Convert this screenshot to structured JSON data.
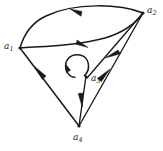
{
  "figure": {
    "kind": "directed-graph",
    "background_color": "#ffffff",
    "ink_color": "#1a1a1a",
    "width": 163,
    "height": 151
  },
  "nodes": [
    {
      "id": "a1",
      "label_base": "a",
      "label_sub": "1",
      "x": 20,
      "y": 48,
      "label_x": 4,
      "label_y": 42,
      "label_align": "right"
    },
    {
      "id": "a2",
      "label_base": "a",
      "label_sub": "2",
      "x": 143,
      "y": 13,
      "label_x": 147,
      "label_y": 6,
      "label_align": "left"
    },
    {
      "id": "a3",
      "label_base": "a",
      "label_sub": "3",
      "x": 87,
      "y": 78,
      "label_x": 91,
      "label_y": 74,
      "label_align": "left"
    },
    {
      "id": "a4",
      "label_base": "a",
      "label_sub": "4",
      "x": 79,
      "y": 126,
      "label_x": 73,
      "label_y": 133,
      "label_align": "left"
    }
  ],
  "edges": [
    {
      "id": "e-a2-a1-top",
      "from": "a2",
      "to": "a1",
      "style": "curved-arc-upper",
      "arrow_at": "mid",
      "arrow_direction": "left"
    },
    {
      "id": "e-a1-a2-bottom",
      "from": "a1",
      "to": "a2",
      "style": "curved-arc-lower",
      "arrow_at": "mid",
      "arrow_direction": "right"
    },
    {
      "id": "e-a2-a3",
      "from": "a2",
      "to": "a3",
      "style": "straight",
      "arrow_at": "mid",
      "arrow_direction": "down-left"
    },
    {
      "id": "e-a3-a4",
      "from": "a3",
      "to": "a4",
      "style": "straight",
      "arrow_at": "mid",
      "arrow_direction": "down"
    },
    {
      "id": "e-a4-a2",
      "from": "a4",
      "to": "a2",
      "style": "straight",
      "arrow_at": "mid",
      "arrow_direction": "up-right"
    },
    {
      "id": "e-a4-a1",
      "from": "a4",
      "to": "a1",
      "style": "straight",
      "arrow_at": "mid",
      "arrow_direction": "up-left"
    }
  ],
  "self_loops": [
    {
      "id": "loop-a3",
      "at": "a3",
      "shape": "circle",
      "center_x": 77,
      "center_y": 67,
      "radius": 11,
      "arrow_direction": "counter-clockwise"
    }
  ]
}
